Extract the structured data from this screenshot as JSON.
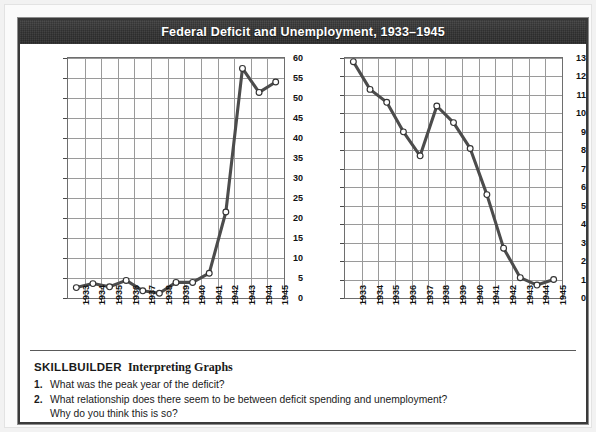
{
  "header": {
    "title": "Federal Deficit and Unemployment, 1933–1945"
  },
  "chart_data": [
    {
      "type": "line",
      "id": "federal-deficit",
      "title": "",
      "xlabel": "",
      "ylabel": "Federal Deficit (in billions of dollars)",
      "ylabel_sub": "(Fiscal year ending June 30)",
      "categories": [
        "1933",
        "1934",
        "1935",
        "1936",
        "1937",
        "1938",
        "1939",
        "1940",
        "1941",
        "1942",
        "1943",
        "1944",
        "1945"
      ],
      "values": [
        2.6,
        3.6,
        2.8,
        4.4,
        1.8,
        1.2,
        3.9,
        3.9,
        6.2,
        21.5,
        57.4,
        51.4,
        54.0
      ],
      "ylim": [
        0,
        60
      ],
      "ytick_step": 5,
      "yticks": [
        "0",
        "5",
        "10",
        "15",
        "20",
        "25",
        "30",
        "35",
        "40",
        "45",
        "50",
        "55",
        "60"
      ],
      "grid": true,
      "legend": "none",
      "marker": "open-circle",
      "line_color": "#4c4c4c"
    },
    {
      "type": "line",
      "id": "unemployment",
      "title": "",
      "xlabel": "",
      "ylabel": "Unemployment (in millions of people)",
      "ylabel_sub": "",
      "categories": [
        "1933",
        "1934",
        "1935",
        "1936",
        "1937",
        "1938",
        "1939",
        "1940",
        "1941",
        "1942",
        "1943",
        "1944",
        "1945"
      ],
      "values": [
        12.8,
        11.3,
        10.6,
        9.0,
        7.7,
        10.4,
        9.5,
        8.1,
        5.6,
        2.7,
        1.1,
        0.7,
        1.0
      ],
      "ylim": [
        0,
        13
      ],
      "ytick_step": 1,
      "yticks": [
        "0",
        "1",
        "2",
        "3",
        "4",
        "5",
        "6",
        "7",
        "8",
        "9",
        "10",
        "11",
        "12",
        "13"
      ],
      "grid": true,
      "legend": "none",
      "marker": "open-circle",
      "line_color": "#4c4c4c"
    }
  ],
  "skillbuilder": {
    "label": "SKILLBUILDER",
    "subtitle": "Interpreting Graphs",
    "questions": [
      {
        "number": "1.",
        "text": "What was the peak year of the deficit?",
        "continuation": ""
      },
      {
        "number": "2.",
        "text": "What relationship does there seem to be between deficit spending and unemployment?",
        "continuation": "Why do you think this is so?"
      }
    ]
  }
}
